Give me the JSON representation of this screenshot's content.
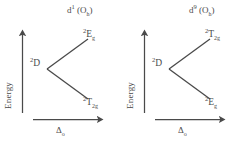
{
  "figure": {
    "background_color": "#ffffff",
    "line_color": "#4a4a4a",
    "text_color": "#4a4a4a"
  },
  "axes": {
    "y_label": "Energy",
    "x_label_symbol": "Δ",
    "x_label_subscript": "o"
  },
  "panels": [
    {
      "id": "left",
      "title": {
        "element": "d",
        "superscript": "1",
        "symmetry": "(O",
        "symmetry_subscript": "h",
        "symmetry_close": ")"
      },
      "free_ion": {
        "multiplicity": "2",
        "term": "D"
      },
      "upper_state": {
        "multiplicity": "2",
        "term": "E",
        "subscript": "g"
      },
      "lower_state": {
        "multiplicity": "2",
        "term": "T",
        "subscript": "2g"
      }
    },
    {
      "id": "right",
      "title": {
        "element": "d",
        "superscript": "9",
        "symmetry": "(O",
        "symmetry_subscript": "h",
        "symmetry_close": ")"
      },
      "free_ion": {
        "multiplicity": "2",
        "term": "D"
      },
      "upper_state": {
        "multiplicity": "2",
        "term": "T",
        "subscript": "2g"
      },
      "lower_state": {
        "multiplicity": "2",
        "term": "E",
        "subscript": "g"
      }
    }
  ]
}
